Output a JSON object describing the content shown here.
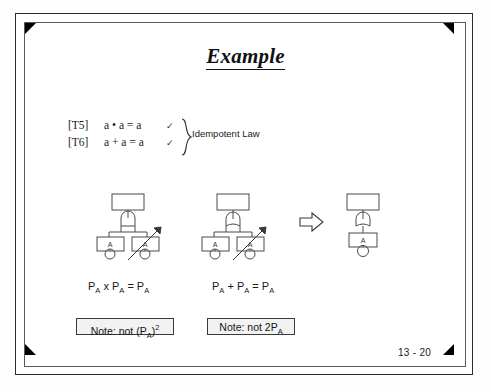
{
  "slide": {
    "title": "Example",
    "page_number": "13 - 20"
  },
  "theorems": {
    "rows": [
      {
        "tag": "[T5]",
        "equation": "a • a = a",
        "check": "✓"
      },
      {
        "tag": "[T6]",
        "equation": "a + a = a",
        "check": "✓"
      }
    ],
    "brace_label": "Idempotent Law"
  },
  "circuits": [
    {
      "name": "and-two-identical-inputs",
      "gate": "and-gate",
      "top_block_label": "",
      "inputs": [
        {
          "label": "A",
          "has_bubble": true,
          "crossed_out": false
        },
        {
          "label": "A",
          "has_bubble": true,
          "crossed_out": true
        }
      ]
    },
    {
      "name": "or-two-identical-inputs",
      "gate": "or-gate",
      "top_block_label": "",
      "inputs": [
        {
          "label": "A",
          "has_bubble": true,
          "crossed_out": false
        },
        {
          "label": "A",
          "has_bubble": true,
          "crossed_out": true
        }
      ]
    },
    {
      "name": "reduced-single-input",
      "gate": "or-gate",
      "top_block_label": "",
      "inputs": [
        {
          "label": "A",
          "has_bubble": true,
          "crossed_out": false
        }
      ]
    }
  ],
  "implies_symbol": "⇒",
  "equations": [
    {
      "html": "P<sub>A</sub> x P<sub>A</sub> = P<sub>A</sub>"
    },
    {
      "html": "P<sub>A</sub> + P<sub>A</sub> = P<sub>A</sub>"
    }
  ],
  "notes": [
    {
      "html": "Note: not (P<sub>A</sub>)<sup>2</sup>"
    },
    {
      "html": "Note: not 2P<sub>A</sub>"
    }
  ],
  "colors": {
    "outer_border": "#2d2d2d",
    "inner_border": "#5b5b5b",
    "corner_marker": "#000000",
    "diagram_stroke": "#4a4a4a",
    "note_fill": "#f2f2f2",
    "text": "#1a1a1a",
    "background": "#ffffff"
  }
}
